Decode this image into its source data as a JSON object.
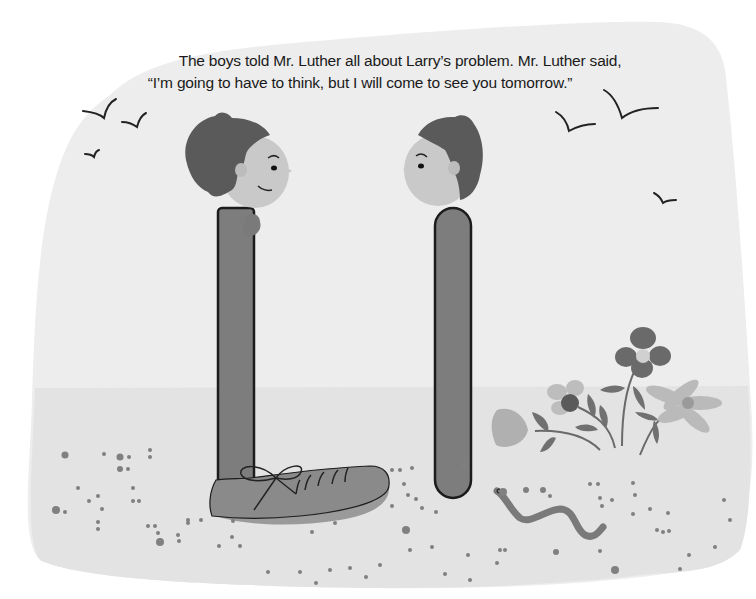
{
  "page": {
    "caption_lines": [
      "The boys told Mr. Luther all about Larry’s problem. Mr. Luther said,",
      "“I’m going to have to think, but I will come to see you tomorrow.”"
    ]
  },
  "illustration": {
    "characters": [
      {
        "name": "left-boy",
        "description": "boy with dark spiky hair, smiling, hand raised at chest"
      },
      {
        "name": "right-boy",
        "description": "boy with dark spiky hair, facing left"
      }
    ],
    "objects": [
      "laced-shoe",
      "worm",
      "flowers",
      "birds",
      "pebbles"
    ],
    "colors": {
      "background_sky": "#ececec",
      "ground": "#e4e4e4",
      "hair": "#5a5a5a",
      "skin": "#c8c8c8",
      "body": "#7d7d7d",
      "outline": "#1c1c1c",
      "shoe": "#8a8a8a",
      "flower_dark": "#6a6a6a",
      "flower_light": "#b4b4b4",
      "text": "#1a1a1a"
    }
  }
}
